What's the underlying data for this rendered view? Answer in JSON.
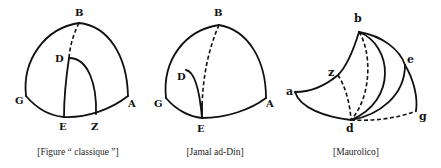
{
  "figures": [
    {
      "id": "classique",
      "caption": "[Figure “ classique ”]",
      "labels": {
        "B": "B",
        "D": "D",
        "G": "G",
        "A": "A",
        "E": "E",
        "Z": "Z"
      }
    },
    {
      "id": "jamal",
      "caption": "[Jamal ad-Din]",
      "labels": {
        "B": "B",
        "D": "D",
        "G": "G",
        "A": "A",
        "E": "E"
      }
    },
    {
      "id": "maurolico",
      "caption": "[Maurolico]",
      "labels": {
        "b": "b",
        "z": "z",
        "a": "a",
        "e": "e",
        "g": "g",
        "d": "d"
      }
    }
  ],
  "colors": {
    "ink": "#111111",
    "background": "#ffffff"
  }
}
